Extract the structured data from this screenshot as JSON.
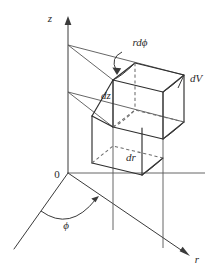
{
  "figure": {
    "type": "geometric-diagram",
    "width": 213,
    "height": 269,
    "background_color": "#ffffff",
    "line_color": "#3a3a3a",
    "hidden_line_color": "#6d6d6d"
  },
  "axes": [
    {
      "id": "z-axis",
      "label": "z",
      "direction": "vertical-up",
      "arrowhead": true,
      "label_position": "left-of-tip"
    },
    {
      "id": "r-axis",
      "label": "r",
      "direction": "lower-right",
      "arrowhead": true,
      "label_position": "right-of-tip"
    },
    {
      "id": "reference-axis",
      "label": "",
      "direction": "lower-left",
      "arrowhead": false,
      "label_position": "none"
    }
  ],
  "origin": {
    "label": "0",
    "x": 68,
    "y": 173
  },
  "angle": {
    "symbol": "ϕ",
    "name": "phi",
    "description": "azimuthal angle measured from the reference axis to the r-axis",
    "arc_arrowhead": true
  },
  "labels": [
    {
      "id": "z-label",
      "text": "z",
      "italic": true,
      "x": 50,
      "y": 18
    },
    {
      "id": "r-label",
      "text": "r",
      "italic": true,
      "x": 196,
      "y": 260
    },
    {
      "id": "origin-label",
      "text": "0",
      "italic": false,
      "x": 57,
      "y": 178
    },
    {
      "id": "phi-label",
      "text": "ϕ",
      "italic": true,
      "x": 66,
      "y": 226
    },
    {
      "id": "rdphi-label",
      "text": "rdϕ",
      "italic": true,
      "x": 126,
      "y": 44
    },
    {
      "id": "dz-label",
      "text": "dz",
      "italic": true,
      "x": 100,
      "y": 96
    },
    {
      "id": "dr-label",
      "text": "dr",
      "italic": true,
      "x": 126,
      "y": 158
    },
    {
      "id": "dV-label",
      "text": "dV",
      "italic": true,
      "x": 191,
      "y": 79
    }
  ],
  "annotations": [
    {
      "id": "rdphi-pointer",
      "target": "top-arc-of-volume-element",
      "style": "curved-arrow",
      "label": "rdϕ"
    },
    {
      "id": "dV-pointer",
      "target": "outer-right-edge-of-volume-element",
      "style": "tick",
      "label": "dV"
    }
  ],
  "volume_element": {
    "name": "dV",
    "shape": "cylindrical-wedge",
    "edges": {
      "radial_extent": "dr",
      "angular_extent": "rdϕ",
      "vertical_extent": "dz"
    },
    "hidden_edges_dashed": true
  }
}
